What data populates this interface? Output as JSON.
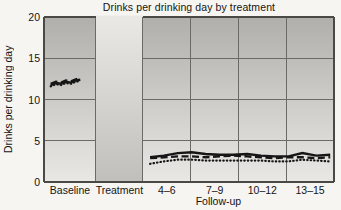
{
  "figure": {
    "title": "Drinks per drinking day by treatment",
    "ylabel": "Drinks per drinking day",
    "xlabel": "Follow-up"
  },
  "colors": {
    "page_background": "#f7f5f1",
    "panel_top": "#b0afac",
    "panel_bottom": "#e9e8e4",
    "band_top": "#eae9e5",
    "band_bottom": "#c0bfbc",
    "grid_line": "#6b6a66",
    "border_line": "#4a4946",
    "data_line": "#161616",
    "text": "#141414"
  },
  "chart_data": {
    "type": "line",
    "title": "Drinks per drinking day by treatment",
    "ylabel": "Drinks per drinking day",
    "xlabel": "Follow-up",
    "ylim": [
      0,
      20
    ],
    "yticks": [
      0,
      5,
      10,
      15,
      20
    ],
    "x_section_labels": [
      "Baseline",
      "Treatment",
      "4–6",
      "7–9",
      "10–12",
      "13–15"
    ],
    "followup_section_indices": [
      2,
      3,
      4,
      5
    ],
    "shaded_section": "Treatment",
    "shaded_section_index": 1,
    "grid": true,
    "legend": "none",
    "section_bounds": [
      0,
      0.179,
      0.341,
      0.506,
      0.671,
      0.835,
      1
    ],
    "series": [
      {
        "name": "dotted",
        "line_style": "dotted",
        "baseline_x": [
          0.13,
          0.23,
          0.33,
          0.42,
          0.52,
          0.61,
          0.7
        ],
        "baseline_y": [
          11.6,
          11.85,
          11.75,
          12.0,
          11.9,
          12.15,
          12.25
        ],
        "followup_x": [
          2.15,
          2.44,
          2.73,
          3.02,
          3.31,
          3.6,
          3.89,
          4.18,
          4.47,
          4.76,
          5.05,
          5.34,
          5.63,
          5.92
        ],
        "followup_y": [
          2.2,
          2.5,
          2.7,
          2.7,
          2.6,
          2.6,
          2.6,
          2.6,
          2.6,
          2.5,
          2.5,
          2.7,
          2.6,
          2.5
        ]
      },
      {
        "name": "dashed",
        "line_style": "dashed",
        "baseline_x": [
          0.13,
          0.23,
          0.33,
          0.42,
          0.52,
          0.61,
          0.7
        ],
        "baseline_y": [
          11.9,
          12.15,
          12.05,
          12.3,
          12.2,
          12.45,
          12.55
        ],
        "followup_x": [
          2.15,
          2.44,
          2.73,
          3.02,
          3.31,
          3.6,
          3.89,
          4.18,
          4.47,
          4.76,
          5.05,
          5.34,
          5.63,
          5.92
        ],
        "followup_y": [
          2.9,
          3.0,
          3.1,
          3.1,
          3.0,
          3.1,
          3.2,
          3.1,
          3.0,
          2.9,
          3.0,
          3.0,
          2.9,
          3.0
        ]
      },
      {
        "name": "solid",
        "line_style": "solid",
        "baseline_x": [
          0.13,
          0.23,
          0.33,
          0.42,
          0.52,
          0.61,
          0.7
        ],
        "baseline_y": [
          11.75,
          12.0,
          11.9,
          12.15,
          12.05,
          12.3,
          12.4
        ],
        "followup_x": [
          2.15,
          2.44,
          2.73,
          3.02,
          3.31,
          3.6,
          3.89,
          4.18,
          4.47,
          4.76,
          5.05,
          5.34,
          5.63,
          5.92
        ],
        "followup_y": [
          3.0,
          3.2,
          3.5,
          3.6,
          3.4,
          3.3,
          3.3,
          3.4,
          3.2,
          3.1,
          3.1,
          3.5,
          3.2,
          3.3
        ]
      }
    ]
  }
}
